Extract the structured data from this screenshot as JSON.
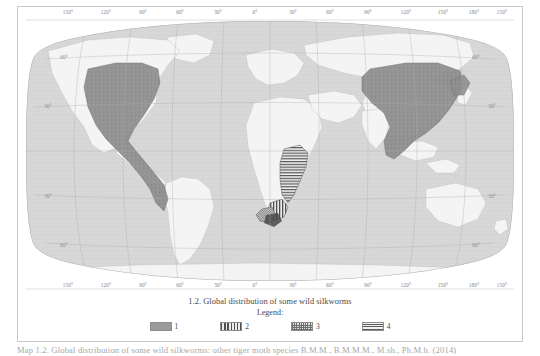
{
  "figure": {
    "title": "1.2. Global distribution of some wild silkworms",
    "legend_heading": "Legend:"
  },
  "legend": {
    "items": [
      {
        "label": "1",
        "pattern": "solid",
        "swatch_name": "legend-swatch-solid"
      },
      {
        "label": "2",
        "pattern": "vstripe",
        "swatch_name": "legend-swatch-vertical-stripes"
      },
      {
        "label": "3",
        "pattern": "check",
        "swatch_name": "legend-swatch-checkered"
      },
      {
        "label": "4",
        "pattern": "hstripe",
        "swatch_name": "legend-swatch-horizontal-stripes"
      }
    ]
  },
  "axes": {
    "longitude_top": [
      "150°",
      "120°",
      "90°",
      "60°",
      "30°",
      "0°",
      "30°",
      "60°",
      "90°",
      "120°",
      "150°",
      "180°",
      "150°"
    ],
    "longitude_bottom": [
      "150°",
      "120°",
      "90°",
      "60°",
      "30°",
      "0°",
      "30°",
      "60°",
      "90°",
      "120°",
      "150°",
      "180°",
      "150°"
    ],
    "latitude_left": [
      "60°",
      "30°",
      "30°",
      "60°"
    ],
    "latitude_right": [
      "60°",
      "30°",
      "30°",
      "60°"
    ]
  },
  "body_caption": {
    "text": "Map 1.2.  Global distribution of some wild silkworms: other tiger moth species   B.M.M.,  B.M.M.M.,  M.sh.,  Ph.M.h.    (2014)"
  },
  "colors": {
    "ocean": "#ffffff",
    "land": "#d5d5d5",
    "range_fill": "#8d8d8d",
    "graticule": "#bdb0a8",
    "frame": "#c9c9c9",
    "text": "#4a4a4a"
  }
}
